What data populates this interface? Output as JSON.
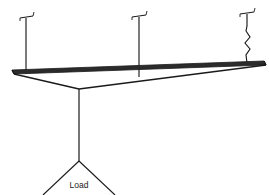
{
  "diagram": {
    "background_color": "#ffffff",
    "stroke_color": "#1a1a1a",
    "beam": {
      "name": "horizontal-beam",
      "top_left": [
        12,
        70
      ],
      "top_right": [
        264,
        61
      ],
      "bottom_left": [
        14,
        75
      ],
      "bottom_right": [
        266,
        66
      ],
      "front_left": [
        12,
        73
      ],
      "junction": [
        79,
        89
      ],
      "stroke_width": 1.4
    },
    "hangers": [
      {
        "id": "hanger-left",
        "type": "rigid-rod",
        "x": 26,
        "top_y": 17,
        "bottom_y": 74,
        "hook_label": "T-anchor"
      },
      {
        "id": "hanger-middle",
        "type": "rigid-rod",
        "x": 139,
        "top_y": 15,
        "bottom_y": 77,
        "hook_label": "T-anchor"
      },
      {
        "id": "hanger-right",
        "type": "spring-rod",
        "x": 247,
        "top_y": 12,
        "bottom_y": 62,
        "hook_label": "T-anchor",
        "zigzag_points": "247,13 247,27 246,32 250,38 245,44 250,50 246,55 247,62"
      }
    ],
    "drop_rod": {
      "name": "center-drop-rod",
      "x_top": 79,
      "y_top": 89,
      "x_bottom": 79,
      "y_bottom": 162
    },
    "load_triangle": {
      "name": "load-triangle",
      "apex": [
        79,
        161
      ],
      "left_base": [
        43,
        195
      ],
      "right_base": [
        115,
        195
      ],
      "label": "Load",
      "label_x": 79,
      "label_y": 187
    }
  }
}
